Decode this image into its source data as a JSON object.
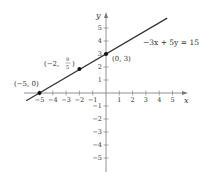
{
  "chart_data": {
    "type": "line",
    "title": "",
    "xlabel": "x",
    "ylabel": "y",
    "xlim": [
      -5.5,
      6
    ],
    "ylim": [
      -6,
      6
    ],
    "grid": false,
    "x_ticks": [
      -5,
      -4,
      -3,
      -2,
      -1,
      1,
      2,
      3,
      4,
      5
    ],
    "y_ticks": [
      -5,
      -4,
      -3,
      -2,
      -1,
      1,
      2,
      3,
      4,
      5
    ],
    "x_tick_labels": [
      "−5",
      "−4",
      "−3",
      "−2",
      "−1",
      "1",
      "2",
      "3",
      "4",
      "5"
    ],
    "y_tick_labels": [
      "−5",
      "−4",
      "−3",
      "−2",
      "−1",
      "1",
      "2",
      "3",
      "4",
      "5"
    ],
    "series": [
      {
        "name": "−3x + 5y = 15",
        "equation": "−3x + 5y = 15",
        "slope": 0.6,
        "intercept": 3,
        "x_range": [
          -6,
          4.6
        ],
        "color": "#333333"
      }
    ],
    "points": [
      {
        "x": -5,
        "y": 0,
        "label": "(−5, 0)"
      },
      {
        "x": -2,
        "y": 1.8,
        "label": "(−2, 9/5)"
      },
      {
        "x": 0,
        "y": 3,
        "label": "(0, 3)"
      }
    ],
    "annotations": [
      {
        "text": "−3x + 5y = 15",
        "near": "line upper right"
      }
    ]
  },
  "labels": {
    "x_axis": "x",
    "y_axis": "y",
    "equation": "−3x + 5y = 15",
    "point_a": "(−5, 0)",
    "point_b_prefix": "(−2,",
    "point_b_num": "9",
    "point_b_den": "5",
    "point_b_suffix": ")",
    "point_c": "(0, 3)"
  }
}
